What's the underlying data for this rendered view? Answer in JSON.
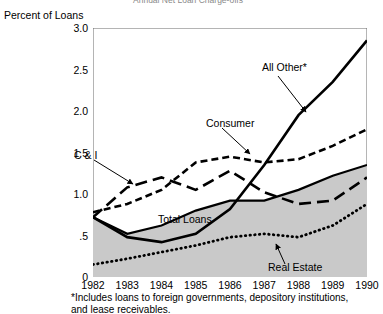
{
  "cut_title": "Annual Net Loan Charge-offs",
  "chart_data": {
    "type": "line",
    "title": "Annual Net Loan Charge-offs",
    "xlabel": "",
    "ylabel": "Percent of Loans",
    "ylim": [
      0,
      3.0
    ],
    "xlim": [
      1982,
      1990
    ],
    "grid": false,
    "legend_position": "inline-annotations",
    "x": [
      1982,
      1983,
      1984,
      1985,
      1986,
      1987,
      1988,
      1989,
      1990
    ],
    "xtick_labels": [
      "1982",
      "1983",
      "1984",
      "1985",
      "1986",
      "1987",
      "1988",
      "1989",
      "1990"
    ],
    "ytick_labels": [
      "0",
      ".5",
      "1.0",
      "1.5",
      "2.0",
      "2.5",
      "3.0"
    ],
    "ytick_values": [
      0,
      0.5,
      1.0,
      1.5,
      2.0,
      2.5,
      3.0
    ],
    "series": [
      {
        "name": "All Other*",
        "style": "solid-thick",
        "values": [
          0.72,
          0.48,
          0.42,
          0.52,
          0.82,
          1.35,
          1.95,
          2.35,
          2.85
        ]
      },
      {
        "name": "Consumer",
        "style": "short-dash",
        "values": [
          0.78,
          0.88,
          1.05,
          1.38,
          1.45,
          1.38,
          1.42,
          1.58,
          1.78
        ]
      },
      {
        "name": "C & I",
        "style": "long-dash",
        "values": [
          0.72,
          1.08,
          1.2,
          1.05,
          1.28,
          1.02,
          0.88,
          0.92,
          1.2
        ]
      },
      {
        "name": "Total Loans",
        "style": "solid-filled",
        "values": [
          0.72,
          0.52,
          0.62,
          0.8,
          0.92,
          0.92,
          1.05,
          1.22,
          1.35
        ]
      },
      {
        "name": "Real Estate",
        "style": "dotted",
        "values": [
          0.15,
          0.22,
          0.3,
          0.38,
          0.48,
          0.52,
          0.48,
          0.62,
          0.88
        ]
      }
    ],
    "annotations": [
      {
        "text": "All Other*",
        "target_series": "All Other*"
      },
      {
        "text": "Consumer",
        "target_series": "Consumer"
      },
      {
        "text": "C & I",
        "target_series": "C & I"
      },
      {
        "text": "Total Loans",
        "target_series": "Total Loans"
      },
      {
        "text": "Real Estate",
        "target_series": "Real Estate"
      }
    ],
    "footnote": "*Includes loans to foreign governments, depository institutions, and lease receivables."
  },
  "footnote_line1": "*Includes loans to foreign governments, depository institutions,",
  "footnote_line2": "and lease receivables."
}
